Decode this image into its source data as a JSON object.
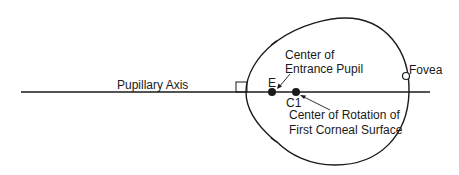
{
  "diagram": {
    "axis_label": "Pupillary Axis",
    "points": {
      "entrance_pupil": {
        "marker": "E",
        "label_line1": "Center of",
        "label_line2": "Entrance Pupil"
      },
      "corneal_center": {
        "marker": "C1",
        "label_line1": "Center of Rotation of",
        "label_line2": "First Corneal Surface"
      },
      "fovea": {
        "label": "Fovea"
      }
    },
    "colors": {
      "stroke": "#1a1a1a",
      "background": "#ffffff"
    }
  }
}
